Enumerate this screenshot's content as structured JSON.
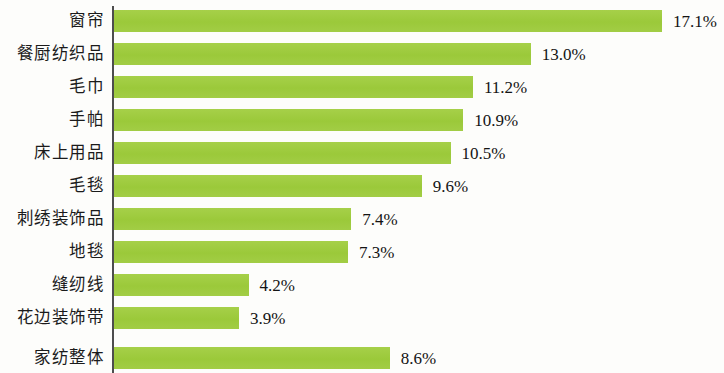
{
  "chart_data": {
    "type": "bar",
    "orientation": "horizontal",
    "title": "",
    "subtitle": "",
    "xlabel": "",
    "ylabel": "",
    "unit": "%",
    "grid": false,
    "legend": null,
    "axis_line": true,
    "xlim": [
      0,
      17.1
    ],
    "bar_color": "#9fcc3f",
    "background_color": "#fdfdfb",
    "text_color": "#1b1b1b",
    "categories": [
      "窗帘",
      "餐厨纺织品",
      "毛巾",
      "手帕",
      "床上用品",
      "毛毯",
      "刺绣装饰品",
      "地毯",
      "缝纫线",
      "花边装饰带",
      "家纺整体"
    ],
    "values": [
      17.1,
      13.0,
      11.2,
      10.9,
      10.5,
      9.6,
      7.4,
      7.3,
      4.2,
      3.9,
      8.6
    ],
    "value_labels": [
      "17.1%",
      "13.0%",
      "11.2%",
      "10.9%",
      "10.5%",
      "9.6%",
      "7.4%",
      "7.3%",
      "4.2%",
      "3.9%",
      "8.6%"
    ]
  }
}
